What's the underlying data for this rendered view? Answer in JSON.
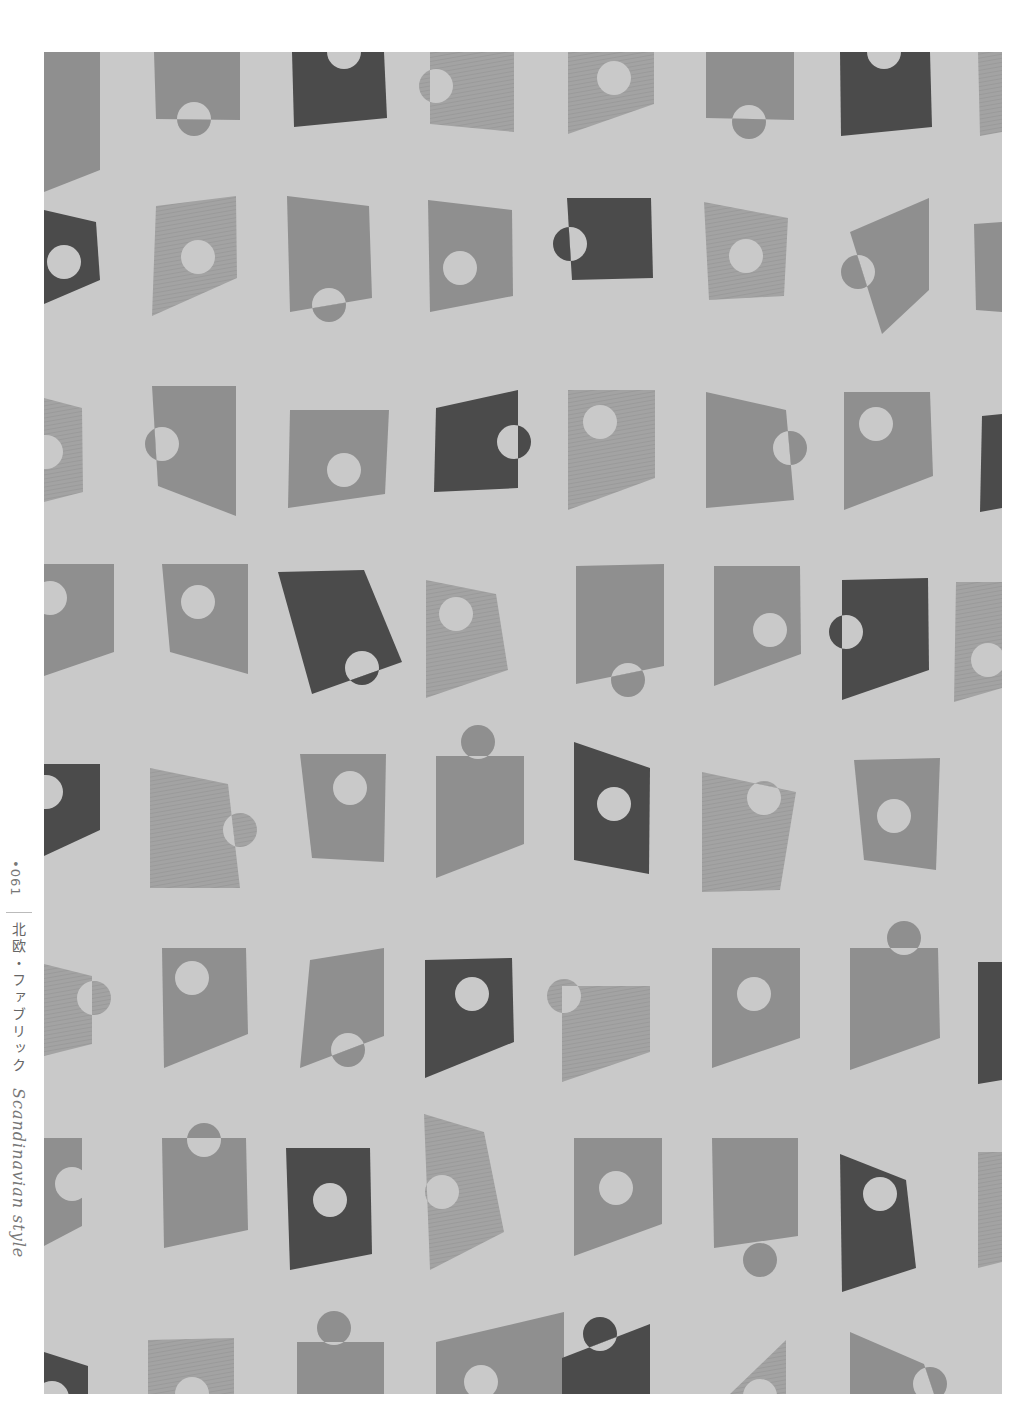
{
  "page": {
    "number": "•061",
    "title_jp": "北欧・ファブリック",
    "title_en": "Scandinavian style"
  },
  "colors": {
    "background": "#c9c9c9",
    "dark": "#4b4b4b",
    "mid": "#8f8f8f",
    "light": "#a3a3a3",
    "hole": "#c9c9c9"
  },
  "fabric": {
    "description": "Repeating pattern of tilted trapezoid patches with circular cut-outs in three gray tones",
    "shapes": [
      {
        "pts": "0,0 56,0 56,118 0,140",
        "tone": "mid"
      },
      {
        "pts": "110,0 196,0 196,68 112,67",
        "tone": "mid",
        "circle": {
          "cx": 150,
          "cy": 67,
          "r": 17,
          "half": "bottom"
        }
      },
      {
        "pts": "248,0 340,0 343,66 250,75",
        "tone": "dark",
        "circle": {
          "cx": 300,
          "cy": 0,
          "r": 17,
          "half": "none"
        }
      },
      {
        "pts": "386,0 470,0 470,80 386,72",
        "tone": "light",
        "circle": {
          "cx": 392,
          "cy": 34,
          "r": 17,
          "half": "left"
        }
      },
      {
        "pts": "524,0 610,0 610,52 524,82",
        "tone": "light",
        "circle": {
          "cx": 570,
          "cy": 26,
          "r": 17,
          "half": "none"
        }
      },
      {
        "pts": "662,0 750,0 750,68 662,66",
        "tone": "mid",
        "circle": {
          "cx": 705,
          "cy": 70,
          "r": 17,
          "half": "bottom"
        }
      },
      {
        "pts": "796,0 886,0 888,75 797,84",
        "tone": "dark",
        "circle": {
          "cx": 840,
          "cy": 0,
          "r": 17,
          "half": "none"
        }
      },
      {
        "pts": "934,0 958,0 958,80 936,84",
        "tone": "light"
      },
      {
        "pts": "0,158 52,170 56,228 0,252",
        "tone": "dark",
        "circle": {
          "cx": 20,
          "cy": 210,
          "r": 17,
          "half": "none"
        }
      },
      {
        "pts": "112,154 192,144 193,226 108,264",
        "tone": "light",
        "circle": {
          "cx": 154,
          "cy": 205,
          "r": 17,
          "half": "none"
        }
      },
      {
        "pts": "243,144 325,154 328,246 246,260",
        "tone": "mid",
        "circle": {
          "cx": 285,
          "cy": 253,
          "r": 17,
          "half": "bottom"
        }
      },
      {
        "pts": "384,148 468,158 469,244 386,260",
        "tone": "mid",
        "circle": {
          "cx": 416,
          "cy": 216,
          "r": 17,
          "half": "none"
        }
      },
      {
        "pts": "523,146 607,146 609,226 528,228",
        "tone": "dark",
        "circle": {
          "cx": 526,
          "cy": 192,
          "r": 17,
          "half": "left"
        }
      },
      {
        "pts": "660,150 744,166 740,244 665,248",
        "tone": "light",
        "circle": {
          "cx": 702,
          "cy": 204,
          "r": 17,
          "half": "none"
        }
      },
      {
        "pts": "806,180 885,146 885,238 838,282",
        "tone": "mid",
        "circle": {
          "cx": 814,
          "cy": 220,
          "r": 17,
          "half": "left"
        }
      },
      {
        "pts": "930,172 958,170 958,260 932,258",
        "tone": "mid"
      },
      {
        "pts": "0,346 38,356 39,440 0,450",
        "tone": "light",
        "circle": {
          "cx": 2,
          "cy": 400,
          "r": 17,
          "half": "none"
        }
      },
      {
        "pts": "108,334 192,334 192,464 114,434",
        "tone": "mid",
        "circle": {
          "cx": 118,
          "cy": 392,
          "r": 17,
          "half": "left"
        }
      },
      {
        "pts": "246,358 345,358 341,442 244,456",
        "tone": "mid",
        "circle": {
          "cx": 300,
          "cy": 418,
          "r": 17,
          "half": "none"
        }
      },
      {
        "pts": "392,356 474,338 474,436 390,440",
        "tone": "dark",
        "circle": {
          "cx": 470,
          "cy": 390,
          "r": 17,
          "half": "right"
        }
      },
      {
        "pts": "524,338 611,338 611,426 524,458",
        "tone": "light",
        "circle": {
          "cx": 556,
          "cy": 370,
          "r": 17,
          "half": "none"
        }
      },
      {
        "pts": "662,340 742,358 750,448 662,456",
        "tone": "mid",
        "circle": {
          "cx": 746,
          "cy": 396,
          "r": 17,
          "half": "right"
        }
      },
      {
        "pts": "800,340 886,340 889,424 800,458",
        "tone": "mid",
        "circle": {
          "cx": 832,
          "cy": 372,
          "r": 17,
          "half": "none"
        }
      },
      {
        "pts": "938,364 958,362 958,456 936,460",
        "tone": "dark"
      },
      {
        "pts": "0,512 70,512 70,600 0,624",
        "tone": "mid",
        "circle": {
          "cx": 6,
          "cy": 546,
          "r": 17,
          "half": "none"
        }
      },
      {
        "pts": "118,512 204,512 204,622 126,600",
        "tone": "mid",
        "circle": {
          "cx": 154,
          "cy": 550,
          "r": 17,
          "half": "none"
        }
      },
      {
        "pts": "234,520 320,518 358,610 268,642",
        "tone": "dark",
        "circle": {
          "cx": 318,
          "cy": 616,
          "r": 17,
          "half": "bottom"
        }
      },
      {
        "pts": "382,528 452,542 464,618 382,646",
        "tone": "light",
        "circle": {
          "cx": 412,
          "cy": 562,
          "r": 17,
          "half": "none"
        }
      },
      {
        "pts": "532,514 620,512 620,614 532,632",
        "tone": "mid",
        "circle": {
          "cx": 584,
          "cy": 628,
          "r": 17,
          "half": "bottom"
        }
      },
      {
        "pts": "670,514 756,514 757,602 670,634",
        "tone": "mid",
        "circle": {
          "cx": 726,
          "cy": 578,
          "r": 17,
          "half": "none"
        }
      },
      {
        "pts": "798,528 884,526 885,618 798,648",
        "tone": "dark",
        "circle": {
          "cx": 802,
          "cy": 580,
          "r": 17,
          "half": "left"
        }
      },
      {
        "pts": "912,530 958,530 958,636 910,650",
        "tone": "light",
        "circle": {
          "cx": 944,
          "cy": 608,
          "r": 17,
          "half": "none"
        }
      },
      {
        "pts": "0,712 56,712 56,778 0,804",
        "tone": "dark",
        "circle": {
          "cx": 2,
          "cy": 740,
          "r": 17,
          "half": "none"
        }
      },
      {
        "pts": "106,716 184,732 196,836 106,836",
        "tone": "light",
        "circle": {
          "cx": 196,
          "cy": 778,
          "r": 17,
          "half": "right"
        }
      },
      {
        "pts": "256,702 342,702 340,810 268,806",
        "tone": "mid",
        "circle": {
          "cx": 306,
          "cy": 736,
          "r": 17,
          "half": "none"
        }
      },
      {
        "pts": "392,704 480,704 480,792 392,826",
        "tone": "mid",
        "circle": {
          "cx": 434,
          "cy": 690,
          "r": 17,
          "half": "top"
        }
      },
      {
        "pts": "530,690 606,716 605,822 530,808",
        "tone": "dark",
        "circle": {
          "cx": 570,
          "cy": 752,
          "r": 17,
          "half": "none"
        }
      },
      {
        "pts": "658,720 752,740 736,838 658,840",
        "tone": "light",
        "circle": {
          "cx": 720,
          "cy": 746,
          "r": 17,
          "half": "top"
        }
      },
      {
        "pts": "810,708 896,706 892,818 820,808",
        "tone": "mid",
        "circle": {
          "cx": 850,
          "cy": 764,
          "r": 17,
          "half": "none"
        }
      },
      {
        "pts": "0,912 48,924 48,992 0,1004",
        "tone": "light",
        "circle": {
          "cx": 50,
          "cy": 946,
          "r": 17,
          "half": "right"
        }
      },
      {
        "pts": "118,896 202,896 204,982 120,1016",
        "tone": "mid",
        "circle": {
          "cx": 148,
          "cy": 926,
          "r": 17,
          "half": "none"
        }
      },
      {
        "pts": "266,908 340,896 340,984 256,1016",
        "tone": "mid",
        "circle": {
          "cx": 304,
          "cy": 998,
          "r": 17,
          "half": "bottom"
        }
      },
      {
        "pts": "381,908 468,906 470,990 381,1026",
        "tone": "dark",
        "circle": {
          "cx": 428,
          "cy": 942,
          "r": 17,
          "half": "none"
        }
      },
      {
        "pts": "518,934 606,934 606,1000 518,1030",
        "tone": "light",
        "circle": {
          "cx": 520,
          "cy": 944,
          "r": 17,
          "half": "left"
        }
      },
      {
        "pts": "668,896 756,896 756,986 668,1016",
        "tone": "mid",
        "circle": {
          "cx": 710,
          "cy": 942,
          "r": 17,
          "half": "none"
        }
      },
      {
        "pts": "806,896 894,896 896,986 806,1018",
        "tone": "mid",
        "circle": {
          "cx": 860,
          "cy": 886,
          "r": 17,
          "half": "top"
        }
      },
      {
        "pts": "934,910 958,910 958,1028 934,1032",
        "tone": "dark"
      },
      {
        "pts": "0,1086 38,1086 38,1174 0,1194",
        "tone": "mid",
        "circle": {
          "cx": 28,
          "cy": 1132,
          "r": 17,
          "half": "none"
        }
      },
      {
        "pts": "118,1086 202,1086 204,1178 120,1196",
        "tone": "mid",
        "circle": {
          "cx": 160,
          "cy": 1088,
          "r": 17,
          "half": "top"
        }
      },
      {
        "pts": "242,1096 326,1096 328,1202 246,1218",
        "tone": "dark",
        "circle": {
          "cx": 286,
          "cy": 1148,
          "r": 17,
          "half": "none"
        }
      },
      {
        "pts": "380,1062 440,1080 460,1180 386,1218",
        "tone": "light",
        "circle": {
          "cx": 398,
          "cy": 1140,
          "r": 17,
          "half": "left"
        }
      },
      {
        "pts": "530,1086 618,1086 618,1172 530,1204",
        "tone": "mid",
        "circle": {
          "cx": 572,
          "cy": 1136,
          "r": 17,
          "half": "none"
        }
      },
      {
        "pts": "668,1086 754,1086 754,1184 670,1196",
        "tone": "mid",
        "circle": {
          "cx": 716,
          "cy": 1208,
          "r": 17,
          "half": "bottom"
        }
      },
      {
        "pts": "796,1102 862,1128 872,1216 798,1240",
        "tone": "dark",
        "circle": {
          "cx": 836,
          "cy": 1142,
          "r": 17,
          "half": "none"
        }
      },
      {
        "pts": "934,1100 958,1100 958,1210 934,1216",
        "tone": "light"
      },
      {
        "pts": "0,1300 44,1314 44,1342 0,1342",
        "tone": "dark",
        "circle": {
          "cx": 8,
          "cy": 1346,
          "r": 17,
          "half": "none"
        }
      },
      {
        "pts": "104,1288 190,1286 190,1342 104,1342",
        "tone": "light",
        "circle": {
          "cx": 148,
          "cy": 1342,
          "r": 17,
          "half": "none"
        }
      },
      {
        "pts": "253,1290 340,1290 340,1342 253,1342",
        "tone": "mid",
        "circle": {
          "cx": 290,
          "cy": 1276,
          "r": 17,
          "half": "top"
        }
      },
      {
        "pts": "392,1290 520,1260 520,1342 392,1342",
        "tone": "mid",
        "circle": {
          "cx": 437,
          "cy": 1330,
          "r": 17,
          "half": "none"
        }
      },
      {
        "pts": "518,1306 606,1272 606,1342 518,1342",
        "tone": "dark",
        "circle": {
          "cx": 556,
          "cy": 1282,
          "r": 17,
          "half": "bottom-diag"
        }
      },
      {
        "pts": "686,1342 742,1288 742,1342",
        "tone": "light",
        "circle": {
          "cx": 716,
          "cy": 1344,
          "r": 17,
          "half": "none"
        }
      },
      {
        "pts": "806,1280 880,1312 890,1342 806,1342",
        "tone": "mid",
        "circle": {
          "cx": 886,
          "cy": 1332,
          "r": 17,
          "half": "right"
        }
      }
    ]
  }
}
